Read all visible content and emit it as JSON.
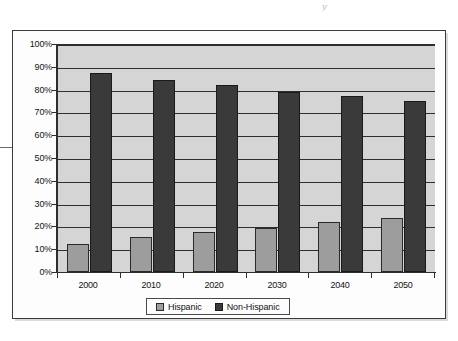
{
  "chart_data": {
    "type": "bar",
    "title": "",
    "subtitle": "",
    "xlabel": "",
    "ylabel": "",
    "categories": [
      "2000",
      "2010",
      "2020",
      "2030",
      "2040",
      "2050"
    ],
    "series": [
      {
        "name": "Hispanic",
        "color": "#9d9d9d",
        "values": [
          12.5,
          15.5,
          17.5,
          19.5,
          22,
          24
        ]
      },
      {
        "name": "Non-Hispanic",
        "color": "#3a3a3a",
        "values": [
          87.5,
          84.5,
          82.5,
          79.5,
          77.5,
          75.5
        ]
      }
    ],
    "ylim": [
      0,
      100
    ],
    "ytick_values": [
      0,
      10,
      20,
      30,
      40,
      50,
      60,
      70,
      80,
      90,
      100
    ],
    "ytick_labels": [
      "0%",
      "10%",
      "20%",
      "30%",
      "40%",
      "50%",
      "60%",
      "70%",
      "80%",
      "90%",
      "100%"
    ],
    "grid": true,
    "grid_axis": "y",
    "legend_position": "bottom",
    "plot_background": "#d5d5d5",
    "value_unit": "percent"
  },
  "legend": {
    "entries": [
      {
        "label": "Hispanic"
      },
      {
        "label": "Non-Hispanic"
      }
    ]
  },
  "artifacts": {
    "top_mark": "y"
  }
}
